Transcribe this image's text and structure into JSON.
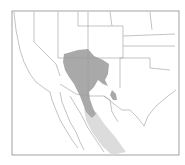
{
  "map": {
    "type": "species range map",
    "region": "Southwestern United States and northern Mexico",
    "colors": {
      "background": "#ffffff",
      "frame": "#888888",
      "borders": "#9a9a9a",
      "range_primary": "#a8a8a8",
      "range_secondary": "#d6d6d6"
    },
    "legend": []
  }
}
